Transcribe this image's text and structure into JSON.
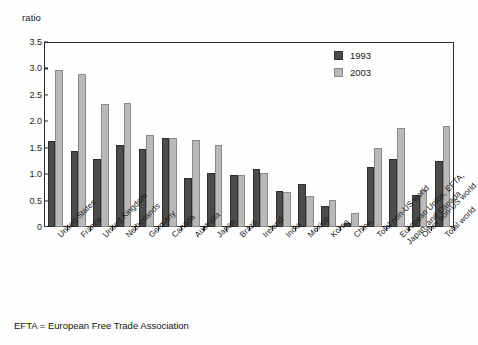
{
  "chart_data": {
    "type": "bar",
    "title": "",
    "subtitle": "",
    "xlabel": "",
    "ylabel": "ratio",
    "ylim": [
      0,
      3.5
    ],
    "ytick_labels": [
      "0",
      "0.5",
      "1.0",
      "1.5",
      "2.0",
      "2.5",
      "3.0",
      "3.5"
    ],
    "ytick_values": [
      0,
      0.5,
      1.0,
      1.5,
      2.0,
      2.5,
      3.0,
      3.5
    ],
    "grid": false,
    "legend_position": "top-right",
    "categories": [
      "United States",
      "France",
      "United Kingdom",
      "Netherlands",
      "Germany",
      "Canada",
      "Australia",
      "Japan",
      "Brazil",
      "Ireland",
      "India",
      "Mexico",
      "Korea",
      "China",
      "Total non-US world",
      "European Union, EFTA,\nJapan, and Canada",
      "Other non-US world",
      "Total world"
    ],
    "series": [
      {
        "name": "1993",
        "color": "#4c4c4c",
        "values": [
          1.63,
          1.43,
          1.29,
          1.55,
          1.48,
          1.68,
          0.93,
          1.03,
          0.98,
          1.1,
          0.69,
          0.82,
          0.4,
          0.08,
          1.13,
          1.29,
          0.61,
          1.24
        ]
      },
      {
        "name": "2003",
        "color": "#b9b9b9",
        "values": [
          2.97,
          2.89,
          2.33,
          2.35,
          1.75,
          1.68,
          1.65,
          1.56,
          0.98,
          1.03,
          0.67,
          0.59,
          0.51,
          0.26,
          1.49,
          1.88,
          0.7,
          1.92
        ]
      }
    ],
    "footnote": "EFTA = European Free Trade Association"
  }
}
